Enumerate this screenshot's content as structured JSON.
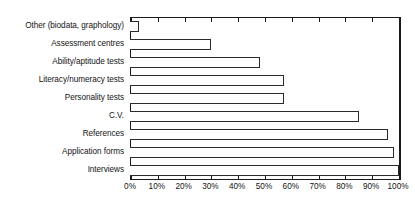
{
  "chart_data": {
    "type": "bar",
    "orientation": "horizontal",
    "title": "",
    "xlabel": "",
    "ylabel": "",
    "xlim": [
      0,
      100
    ],
    "xtick_labels": [
      "0%",
      "10%",
      "20%",
      "30%",
      "40%",
      "50%",
      "60%",
      "70%",
      "80%",
      "90%",
      "100%"
    ],
    "xtick_values": [
      0,
      10,
      20,
      30,
      40,
      50,
      60,
      70,
      80,
      90,
      100
    ],
    "grid": false,
    "legend": false,
    "categories": [
      "Other (biodata, graphology)",
      "Assessment centres",
      "Ability/aptitude tests",
      "Literacy/numeracy tests",
      "Personality tests",
      "C.V.",
      "References",
      "Application forms",
      "Interviews"
    ],
    "values": [
      3,
      30,
      48,
      57,
      57,
      85,
      96,
      98,
      100
    ],
    "value_unit": "%",
    "bar_fill_color": "#ffffff",
    "bar_edge_color": "#2b2b2b",
    "axis_color": "#1a1a1a",
    "background_color": "#ffffff"
  }
}
